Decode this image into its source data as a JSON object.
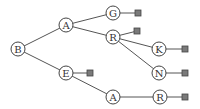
{
  "diagram": {
    "type": "trie",
    "nodes": [
      {
        "id": "n_B",
        "label": "B",
        "x": 18,
        "y": 49
      },
      {
        "id": "n_A1",
        "label": "A",
        "x": 66,
        "y": 25
      },
      {
        "id": "n_E",
        "label": "E",
        "x": 66,
        "y": 73
      },
      {
        "id": "n_G",
        "label": "G",
        "x": 113,
        "y": 13
      },
      {
        "id": "n_R1",
        "label": "R",
        "x": 113,
        "y": 37
      },
      {
        "id": "n_K",
        "label": "K",
        "x": 159,
        "y": 49
      },
      {
        "id": "n_N",
        "label": "N",
        "x": 159,
        "y": 73
      },
      {
        "id": "n_A2",
        "label": "A",
        "x": 113,
        "y": 97
      },
      {
        "id": "n_R2",
        "label": "R",
        "x": 160,
        "y": 97
      }
    ],
    "terminals": [
      {
        "id": "t_G",
        "x": 138,
        "y": 13
      },
      {
        "id": "t_R1",
        "x": 137,
        "y": 31
      },
      {
        "id": "t_K",
        "x": 185,
        "y": 49
      },
      {
        "id": "t_N",
        "x": 185,
        "y": 73
      },
      {
        "id": "t_E",
        "x": 90,
        "y": 73
      },
      {
        "id": "t_R2",
        "x": 185,
        "y": 97
      }
    ],
    "edges": [
      [
        "n_B",
        "n_A1"
      ],
      [
        "n_B",
        "n_E"
      ],
      [
        "n_A1",
        "n_G"
      ],
      [
        "n_A1",
        "n_R1"
      ],
      [
        "n_R1",
        "n_K"
      ],
      [
        "n_R1",
        "n_N"
      ],
      [
        "n_E",
        "n_A2"
      ],
      [
        "n_A2",
        "n_R2"
      ],
      [
        "n_G",
        "t_G"
      ],
      [
        "n_R1",
        "t_R1"
      ],
      [
        "n_K",
        "t_K"
      ],
      [
        "n_N",
        "t_N"
      ],
      [
        "n_E",
        "t_E"
      ],
      [
        "n_R2",
        "t_R2"
      ]
    ],
    "words": [
      "BAG",
      "BAR",
      "BARK",
      "BARN",
      "BE",
      "BEAR"
    ]
  }
}
